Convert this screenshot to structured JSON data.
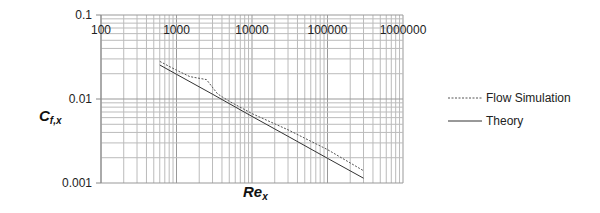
{
  "chart_data": {
    "type": "line",
    "title": "",
    "xlabel": "Re_x",
    "ylabel": "C_f,x",
    "xscale": "log",
    "yscale": "log",
    "xlim": [
      100,
      1000000
    ],
    "ylim": [
      0.001,
      0.1
    ],
    "x_tick_labels": [
      "100",
      "1000",
      "10000",
      "100000",
      "1000000"
    ],
    "y_tick_labels": [
      "0.1",
      "0.01",
      "0.001"
    ],
    "grid": true,
    "legend_position": "right",
    "series": [
      {
        "name": "Flow Simulation",
        "style": "dashed",
        "x": [
          600,
          1000,
          1500,
          2500,
          3500,
          5000,
          10000,
          30000,
          100000,
          300000
        ],
        "y": [
          0.028,
          0.022,
          0.0185,
          0.017,
          0.0115,
          0.0094,
          0.0067,
          0.0043,
          0.0025,
          0.0014
        ]
      },
      {
        "name": "Theory",
        "style": "solid",
        "x": [
          600,
          1000,
          3000,
          10000,
          30000,
          100000,
          300000
        ],
        "y": [
          0.0254,
          0.0197,
          0.0114,
          0.0062,
          0.0036,
          0.00197,
          0.00114
        ]
      }
    ]
  },
  "labels": {
    "x_axis": "Re",
    "x_axis_sub": "x",
    "y_axis": "C",
    "y_axis_sub": "f,x"
  },
  "legend": [
    {
      "label": "Flow Simulation",
      "style": "dashed"
    },
    {
      "label": "Theory",
      "style": "solid"
    }
  ]
}
